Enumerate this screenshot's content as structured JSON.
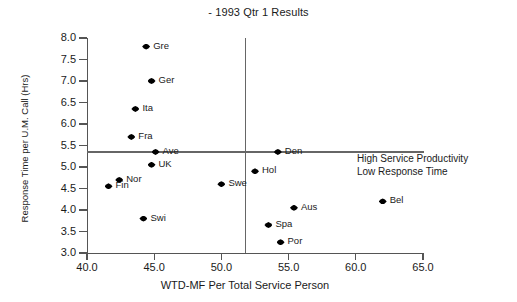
{
  "chart_data": {
    "type": "scatter",
    "title": "- 1993 Qtr 1 Results",
    "xlabel": "WTD-MF Per Total Service Person",
    "ylabel": "Response Time per U.M. Call (Hrs)",
    "xlim": [
      40.0,
      65.0
    ],
    "ylim": [
      3.0,
      8.0
    ],
    "xticks": [
      "40.0",
      "45.0",
      "50.0",
      "55.0",
      "60.0",
      "65.0"
    ],
    "xtick_values": [
      40.0,
      45.0,
      50.0,
      55.0,
      60.0,
      65.0
    ],
    "yticks": [
      "3.0",
      "3.5",
      "4.0",
      "4.5",
      "5.0",
      "5.5",
      "6.0",
      "6.5",
      "7.0",
      "7.5",
      "8.0"
    ],
    "ytick_values": [
      3.0,
      3.5,
      4.0,
      4.5,
      5.0,
      5.5,
      6.0,
      6.5,
      7.0,
      7.5,
      8.0
    ],
    "grid": false,
    "legend": "none",
    "points": [
      {
        "label": "Gre",
        "x": 44.4,
        "y": 7.8
      },
      {
        "label": "Ger",
        "x": 44.8,
        "y": 7.0
      },
      {
        "label": "Ita",
        "x": 43.6,
        "y": 6.35
      },
      {
        "label": "Fra",
        "x": 43.3,
        "y": 5.7
      },
      {
        "label": "Ave",
        "x": 45.1,
        "y": 5.35
      },
      {
        "label": "UK",
        "x": 44.8,
        "y": 5.05
      },
      {
        "label": "Nor",
        "x": 42.4,
        "y": 4.7
      },
      {
        "label": "Fin",
        "x": 41.6,
        "y": 4.55
      },
      {
        "label": "Swi",
        "x": 44.2,
        "y": 3.8
      },
      {
        "label": "Swe",
        "x": 50.0,
        "y": 4.6
      },
      {
        "label": "Hol",
        "x": 52.5,
        "y": 4.9
      },
      {
        "label": "Den",
        "x": 54.2,
        "y": 5.35
      },
      {
        "label": "Aus",
        "x": 55.4,
        "y": 4.05
      },
      {
        "label": "Spa",
        "x": 53.5,
        "y": 3.65
      },
      {
        "label": "Por",
        "x": 54.4,
        "y": 3.25
      },
      {
        "label": "Bel",
        "x": 62.0,
        "y": 4.2
      }
    ],
    "reference_lines": [
      {
        "orientation": "horizontal",
        "value": 5.35
      },
      {
        "orientation": "vertical",
        "value": 51.8
      }
    ],
    "annotations": [
      {
        "line1": "High Service Productivity",
        "line2": "Low Response Time"
      }
    ]
  }
}
